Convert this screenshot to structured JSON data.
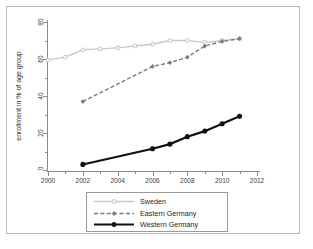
{
  "figure": {
    "y_axis_title": "enrollment in % of age group"
  },
  "chart_data": {
    "type": "line",
    "title": "",
    "xlabel": "",
    "ylabel": "enrollment in % of age group",
    "xlim": [
      2000,
      2012
    ],
    "ylim": [
      0,
      80
    ],
    "xticks": [
      "2000",
      "2002",
      "2004",
      "2006",
      "2008",
      "2010",
      "2012"
    ],
    "yticks": [
      "0",
      "20",
      "40",
      "60",
      "80"
    ],
    "grid": false,
    "legend_position": "below-plot",
    "series": [
      {
        "name": "Sweden",
        "color": "#c9c9c9",
        "style": "solid",
        "marker": "circle",
        "x": [
          2000,
          2001,
          2002,
          2003,
          2004,
          2005,
          2006,
          2007,
          2008,
          2009,
          2010,
          2011
        ],
        "values": [
          59.5,
          61,
          65,
          65.5,
          66,
          67,
          68,
          70,
          70,
          69,
          70,
          71
        ]
      },
      {
        "name": "Eastern Germany",
        "color": "#7a7a7a",
        "style": "dashed",
        "marker": "diamond",
        "x": [
          2002,
          2006,
          2007,
          2008,
          2009,
          2010,
          2011
        ],
        "values": [
          37,
          56,
          58,
          61,
          67,
          69.5,
          71
        ]
      },
      {
        "name": "Western Germany",
        "color": "#111111",
        "style": "solid",
        "marker": "plus",
        "x": [
          2002,
          2006,
          2007,
          2008,
          2009,
          2010,
          2011
        ],
        "values": [
          3,
          11.5,
          14,
          18,
          21,
          25,
          29
        ]
      }
    ]
  },
  "legend": {
    "entries": [
      {
        "label": "Sweden"
      },
      {
        "label": "Eastern Germany"
      },
      {
        "label": "Western Germany"
      }
    ]
  }
}
